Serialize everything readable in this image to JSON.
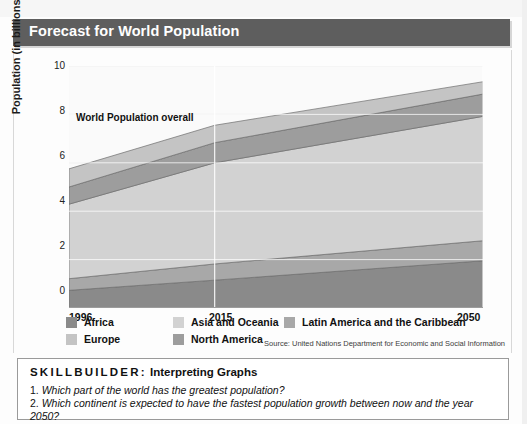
{
  "title": "Forecast for World Population",
  "annotation": "World Population overall",
  "source": "Source: United Nations Department for Economic and Social Information",
  "axis": {
    "y_title": "Population (in billions)",
    "y_ticks": [
      "10",
      "8",
      "6",
      "4",
      "2",
      "0"
    ],
    "x_ticks": [
      "1996",
      "2015",
      "2050"
    ]
  },
  "legend": [
    {
      "label": "Africa",
      "color": "#8a8a8a"
    },
    {
      "label": "Europe",
      "color": "#c4c4c4"
    },
    {
      "label": "Asia and Oceania",
      "color": "#d2d2d2"
    },
    {
      "label": "North America",
      "color": "#9d9d9d"
    },
    {
      "label": "Latin America and the Caribbean",
      "color": "#a8a8a8"
    }
  ],
  "skillbuilder": {
    "label": "SKILLBUILDER:",
    "title": "Interpreting Graphs",
    "q1_num": "1.",
    "q1": "Which part of the world has the greatest population?",
    "q2_num": "2.",
    "q2": "Which continent is expected to have the fastest population growth between now and the year 2050?"
  },
  "chart_data": {
    "type": "area",
    "title": "Forecast for World Population",
    "xlabel": "",
    "ylabel": "Population (in billions)",
    "x": [
      1996,
      2015,
      2050
    ],
    "xlim": [
      1996,
      2050
    ],
    "ylim": [
      0,
      10
    ],
    "ytick_values": [
      0,
      2,
      4,
      6,
      8,
      10
    ],
    "grid": true,
    "stacked": true,
    "legend_position": "bottom",
    "annotations": [
      {
        "text": "World Population overall",
        "x": 1996,
        "y": 7.4
      }
    ],
    "series": [
      {
        "name": "Africa",
        "color": "#8a8a8a",
        "values": [
          0.73,
          1.15,
          1.95
        ]
      },
      {
        "name": "Latin America and the Caribbean",
        "color": "#a8a8a8",
        "values": [
          0.48,
          0.67,
          0.83
        ]
      },
      {
        "name": "Asia and Oceania",
        "color": "#d2d2d2",
        "values": [
          3.08,
          4.18,
          5.14
        ]
      },
      {
        "name": "North America",
        "color": "#9d9d9d",
        "values": [
          0.71,
          0.83,
          0.92
        ]
      },
      {
        "name": "Europe",
        "color": "#c4c4c4",
        "values": [
          0.75,
          0.72,
          0.51
        ]
      }
    ],
    "cumulative_totals": [
      5.75,
      7.55,
      9.35
    ]
  }
}
